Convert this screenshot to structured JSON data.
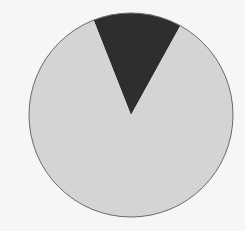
{
  "chart_data": {
    "type": "pie",
    "title": "",
    "categories": [
      "Slice A",
      "Slice B"
    ],
    "values": [
      14,
      86
    ],
    "colors": [
      "#2e2e2e",
      "#d4d4d4"
    ],
    "start_angle_deg": -21.5,
    "direction": "clockwise",
    "legend": "none",
    "labels_visible": false,
    "outline_color": "#6a6a6a",
    "background": "#f6f6f4",
    "center": [
      131,
      115
    ],
    "radius": 102
  }
}
